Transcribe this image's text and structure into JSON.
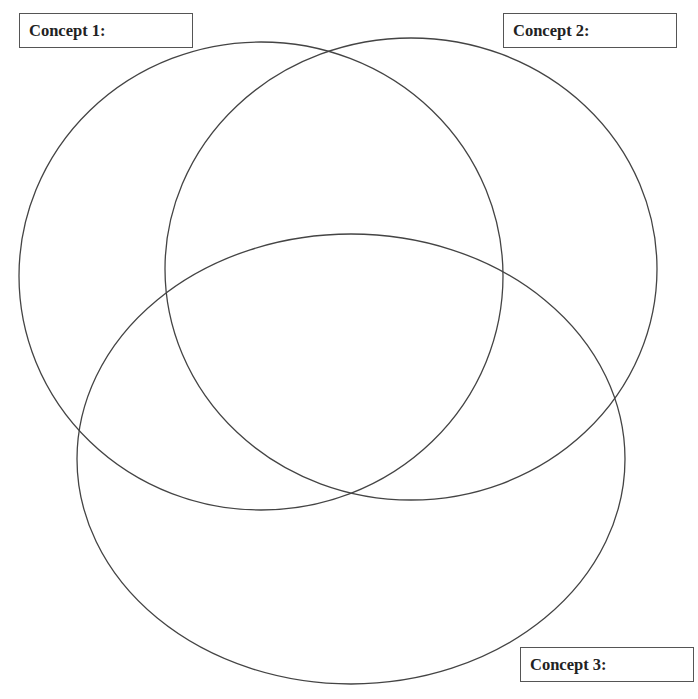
{
  "diagram": {
    "type": "venn",
    "set_count": 3,
    "stroke_color": "#444444",
    "background": "#ffffff",
    "sets": [
      {
        "id": "concept-1",
        "label": "Concept 1:",
        "cx": 261,
        "cy": 276,
        "rx": 242,
        "ry": 234
      },
      {
        "id": "concept-2",
        "label": "Concept 2:",
        "cx": 411,
        "cy": 269,
        "rx": 246,
        "ry": 231
      },
      {
        "id": "concept-3",
        "label": "Concept 3:",
        "cx": 351,
        "cy": 459,
        "rx": 274,
        "ry": 225
      }
    ]
  },
  "labels": {
    "concept_1": "Concept 1:",
    "concept_2": "Concept 2:",
    "concept_3": "Concept 3:"
  }
}
